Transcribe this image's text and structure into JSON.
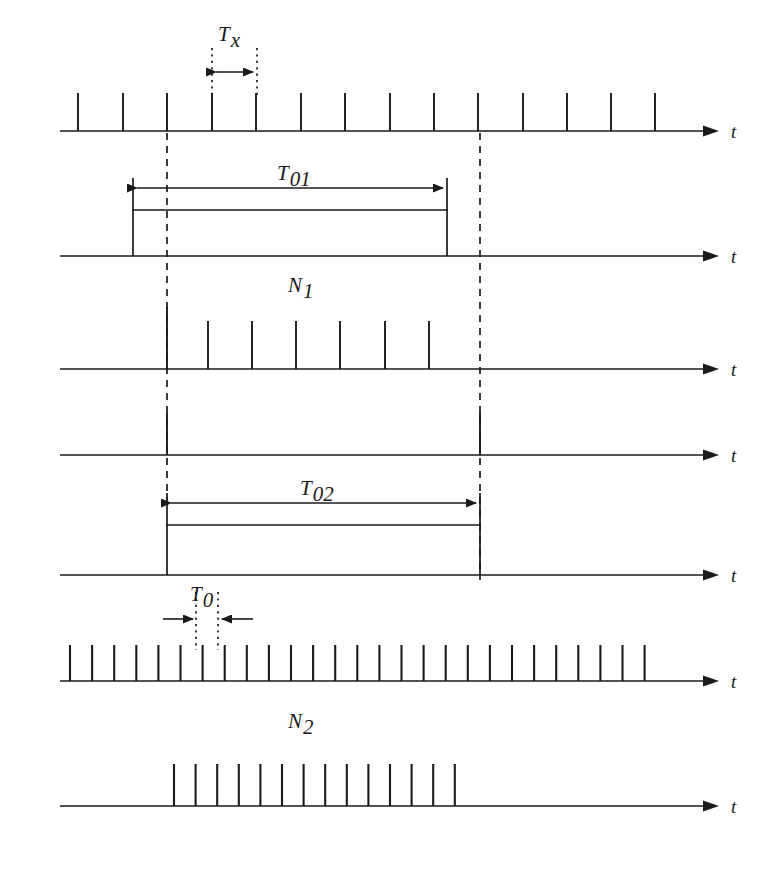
{
  "figure": {
    "background_color": "#ffffff",
    "ink_color": "#1a1a1a",
    "width": 759,
    "height": 869
  },
  "labels": {
    "tx": "T",
    "tx_sub": "x",
    "t01": "T",
    "t01_sub": "01",
    "n1": "N",
    "n1_sub": "1",
    "t02": "T",
    "t02_sub": "02",
    "t0": "T",
    "t0_sub": "0",
    "n2": "N",
    "n2_sub": "2",
    "axis_t": "t"
  },
  "axes": [
    {
      "name": "axis-row-1",
      "y": 131,
      "x_start": 60,
      "x_end": 712,
      "label": "t",
      "label_x": 733
    },
    {
      "name": "axis-row-2",
      "y": 256,
      "x_start": 60,
      "x_end": 712,
      "label": "t",
      "label_x": 733
    },
    {
      "name": "axis-row-3",
      "y": 369,
      "x_start": 60,
      "x_end": 712,
      "label": "t",
      "label_x": 733
    },
    {
      "name": "axis-row-4",
      "y": 455,
      "x_start": 60,
      "x_end": 712,
      "label": "t",
      "label_x": 733
    },
    {
      "name": "axis-row-5",
      "y": 575,
      "x_start": 60,
      "x_end": 712,
      "label": "t",
      "label_x": 733
    },
    {
      "name": "axis-row-6",
      "y": 681,
      "x_start": 60,
      "x_end": 712,
      "label": "t",
      "label_x": 733
    },
    {
      "name": "axis-row-7",
      "y": 806,
      "x_start": 60,
      "x_end": 712,
      "label": "t",
      "label_x": 733
    }
  ],
  "rows": {
    "row1_unknown_clock": {
      "description": "Input signal pulse train of unknown period Tx",
      "axis_y": 131,
      "pulse_height": 38,
      "pulse_x": [
        78,
        123,
        167,
        212,
        256,
        301,
        345,
        390,
        434,
        478,
        523,
        567,
        611,
        655
      ],
      "pulse_count": 14,
      "period_px": 44.4
    },
    "row2_gate_t01": {
      "description": "Gate window T01 opened by input edge",
      "axis_y": 256,
      "gate_left_x": 133,
      "gate_right_x": 447,
      "gate_top_y": 210,
      "dimension_y": 187,
      "label_x": 290,
      "label_y": 180
    },
    "row3_n1_count": {
      "description": "Counted input pulses N1 during gate",
      "axis_y": 369,
      "pulse_height": 48,
      "tall_pulse_x": 167,
      "tall_pulse_height": 62,
      "pulse_x": [
        208,
        252,
        296,
        340,
        385,
        429
      ],
      "pulse_count": 7,
      "label_x": 290,
      "label_y": 292
    },
    "row4_sync_window": {
      "description": "Synchronized window edges",
      "axis_y": 455,
      "edge_left_x": 167,
      "edge_right_x": 480,
      "edge_height": 42
    },
    "row5_gate_t02": {
      "description": "Synchronized gate window T02",
      "axis_y": 575,
      "gate_left_x": 167,
      "gate_right_x": 480,
      "gate_top_y": 525,
      "dimension_y": 503,
      "label_x": 310,
      "label_y": 494
    },
    "row6_reference_clock": {
      "description": "Reference clock train of period T0",
      "axis_y": 681,
      "pulse_height": 36,
      "pulse_start_x": 70,
      "pulse_spacing_px": 22.1,
      "pulse_count": 27,
      "t0_marker": {
        "left_x": 196,
        "right_x": 218,
        "arrow_y": 619,
        "arrow_span_left": 163,
        "arrow_span_right": 253,
        "label_x": 197,
        "label_y": 601
      }
    },
    "row7_n2_count": {
      "description": "Counted reference pulses N2 during gate",
      "axis_y": 806,
      "pulse_height": 42,
      "pulse_start_x": 174,
      "pulse_spacing_px": 21.6,
      "pulse_count": 14,
      "label_x": 290,
      "label_y": 728
    }
  },
  "guides": {
    "dashed_vertical_left": {
      "x": 167,
      "y_top": 131,
      "y_bottom": 500
    },
    "dashed_vertical_right": {
      "x": 480,
      "y_top": 131,
      "y_bottom": 580
    },
    "tx_dotted_left": {
      "x": 212,
      "y_top": 48,
      "y_bottom": 100
    },
    "tx_dotted_right": {
      "x": 257,
      "y_top": 48,
      "y_bottom": 100
    },
    "tx_arrow_y": 72,
    "tx_label_x": 226,
    "tx_label_y": 40,
    "t0_dotted_left": {
      "x": 196,
      "y_top": 592,
      "y_bottom": 648
    },
    "t0_dotted_right": {
      "x": 218,
      "y_top": 592,
      "y_bottom": 648
    }
  }
}
